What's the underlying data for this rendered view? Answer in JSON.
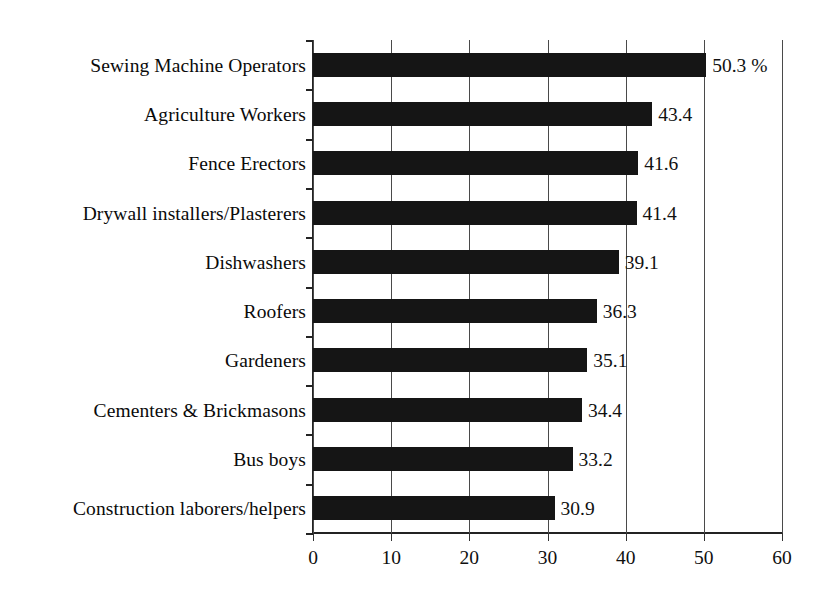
{
  "chart_data": {
    "type": "bar",
    "orientation": "horizontal",
    "title": "",
    "xlabel": "",
    "ylabel": "",
    "xlim": [
      0,
      60
    ],
    "xticks": [
      "0",
      "10",
      "20",
      "30",
      "40",
      "50",
      "60"
    ],
    "xtick_values": [
      0,
      10,
      20,
      30,
      40,
      50,
      60
    ],
    "grid": "vertical",
    "legend": "none",
    "unit_suffix": "%",
    "categories": [
      "Sewing Machine Operators",
      "Agriculture Workers",
      "Fence Erectors",
      "Drywall installers/Plasterers",
      "Dishwashers",
      "Roofers",
      "Gardeners",
      "Cementers & Brickmasons",
      "Bus boys",
      "Construction laborers/helpers"
    ],
    "values": [
      50.3,
      43.4,
      41.6,
      41.4,
      39.1,
      36.3,
      35.1,
      34.4,
      33.2,
      30.9
    ],
    "value_labels": [
      "50.3 %",
      "43.4",
      "41.6",
      "41.4",
      "39.1",
      "36.3",
      "35.1",
      "34.4",
      "33.2",
      "30.9"
    ],
    "bar_color": "#151515",
    "axis_color": "#232323",
    "grid_color": "#4a4a4a",
    "background_color": "#ffffff"
  }
}
